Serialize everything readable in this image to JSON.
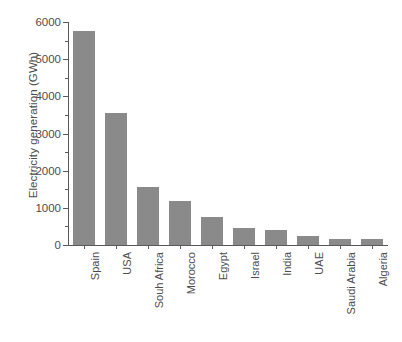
{
  "chart_data": {
    "type": "bar",
    "title": "",
    "subtitle": "",
    "xlabel": "",
    "ylabel": "Electricity generation (GWh)",
    "categories": [
      "Spain",
      "USA",
      "Souh Africa",
      "Morocco",
      "Egypt",
      "Israel",
      "India",
      "UAE",
      "Saudi Arabia",
      "Algeria"
    ],
    "values": [
      5760,
      3550,
      1560,
      1180,
      750,
      460,
      400,
      240,
      175,
      160
    ],
    "series": [
      {
        "name": "Electricity generation",
        "values": [
          5760,
          3550,
          1560,
          1180,
          750,
          460,
          400,
          240,
          175,
          160
        ]
      }
    ],
    "ylim": [
      0,
      6000
    ],
    "ytick_values": [
      0,
      1000,
      2000,
      3000,
      4000,
      5000,
      6000
    ],
    "ytick_labels": [
      "0",
      "1000",
      "2000",
      "3000",
      "4000",
      "5000",
      "6000"
    ],
    "yminor_tick_values": [
      500,
      1500,
      2500,
      3500,
      4500,
      5500
    ],
    "grid": false,
    "legend": false,
    "legend_position": "none",
    "bar_color": "#8a8a8a",
    "axis_color": "#595959",
    "text_color": "#4d4d4d",
    "background_color": "#ffffff"
  }
}
